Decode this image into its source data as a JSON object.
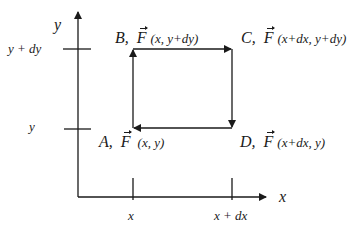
{
  "diagram": {
    "axes": {
      "x_axis_label": "x",
      "y_axis_label": "y",
      "x_ticks": [
        {
          "label": "x"
        },
        {
          "label": "x + dx"
        }
      ],
      "y_ticks": [
        {
          "label": "y"
        },
        {
          "label": "y + dy"
        }
      ]
    },
    "points": {
      "A": {
        "letter": "A,",
        "vector": "F",
        "coords": "(x, y)"
      },
      "B": {
        "letter": "B,",
        "vector": "F",
        "coords": "(x, y+dy)"
      },
      "C": {
        "letter": "C,",
        "vector": "F",
        "coords": "(x+dx, y+dy)"
      },
      "D": {
        "letter": "D,",
        "vector": "F",
        "coords": "(x+dx, y)"
      }
    },
    "path_direction": "A → B → C → D → A",
    "colors": {
      "line": "#1a1a1a",
      "background": "#ffffff"
    }
  }
}
